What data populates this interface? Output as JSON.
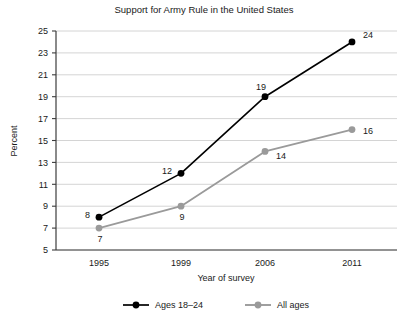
{
  "chart_data": {
    "type": "line",
    "title": "Support for Army Rule in the United States",
    "xlabel": "Year of survey",
    "ylabel": "Percent",
    "categories": [
      "1995",
      "1999",
      "2006",
      "2011"
    ],
    "x": [
      1995,
      1999,
      2006,
      2011
    ],
    "ylim": [
      5,
      25
    ],
    "yticks": [
      5,
      7,
      9,
      11,
      13,
      15,
      17,
      19,
      21,
      23,
      25
    ],
    "grid": true,
    "legend_position": "bottom",
    "series": [
      {
        "name": "Ages 18–24",
        "color": "#000000",
        "values": [
          8,
          12,
          19,
          24
        ],
        "labels": [
          "8",
          "12",
          "19",
          "24"
        ]
      },
      {
        "name": "All ages",
        "color": "#9a9a9a",
        "values": [
          7,
          9,
          14,
          16
        ],
        "labels": [
          "7",
          "9",
          "14",
          "16"
        ]
      }
    ]
  },
  "legend": {
    "entries": [
      {
        "label": "Ages 18–24",
        "color": "#000000"
      },
      {
        "label": "All ages",
        "color": "#9a9a9a"
      }
    ]
  },
  "colors": {
    "background": "#ffffff",
    "text": "#1a1a1a",
    "gridline": "#c9c9c9",
    "axis": "#3c3c3c",
    "series_young": "#000000",
    "series_all": "#9a9a9a"
  }
}
